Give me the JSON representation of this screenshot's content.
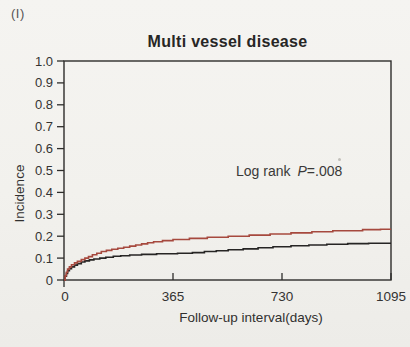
{
  "figure": {
    "panel_label": "(I)"
  },
  "chart_data": {
    "type": "line",
    "subtype": "step-cumulative-incidence",
    "title": "Multi vessel disease",
    "xlabel": "Follow-up interval(days)",
    "ylabel": "Incidence",
    "xlim": [
      0,
      1095
    ],
    "ylim": [
      0,
      1.0
    ],
    "grid": false,
    "legend": "none",
    "axis_color": "#2e2d2b",
    "text_color": "#343332",
    "xticks": [
      {
        "value": 0,
        "label": "0"
      },
      {
        "value": 365,
        "label": "365"
      },
      {
        "value": 730,
        "label": "730"
      },
      {
        "value": 1095,
        "label": "1095"
      }
    ],
    "yticks": [
      {
        "value": 0.0,
        "label": "0"
      },
      {
        "value": 0.1,
        "label": "0.1"
      },
      {
        "value": 0.2,
        "label": "0.2"
      },
      {
        "value": 0.3,
        "label": "0.3"
      },
      {
        "value": 0.4,
        "label": "0.4"
      },
      {
        "value": 0.5,
        "label": "0.5"
      },
      {
        "value": 0.6,
        "label": "0.6"
      },
      {
        "value": 0.7,
        "label": "0.7"
      },
      {
        "value": 0.8,
        "label": "0.8"
      },
      {
        "value": 0.9,
        "label": "0.9"
      },
      {
        "value": 1.0,
        "label": "1.0"
      }
    ],
    "annotation": {
      "prefix": "Log rank",
      "p_symbol": "P",
      "suffix": "=.008"
    },
    "series": [
      {
        "name": "black-curve",
        "color": "#262524",
        "points": [
          [
            0,
            0
          ],
          [
            4,
            0.018
          ],
          [
            8,
            0.03
          ],
          [
            12,
            0.042
          ],
          [
            18,
            0.052
          ],
          [
            25,
            0.06
          ],
          [
            35,
            0.068
          ],
          [
            45,
            0.075
          ],
          [
            58,
            0.082
          ],
          [
            70,
            0.087
          ],
          [
            85,
            0.092
          ],
          [
            100,
            0.096
          ],
          [
            120,
            0.1
          ],
          [
            140,
            0.104
          ],
          [
            165,
            0.108
          ],
          [
            190,
            0.111
          ],
          [
            220,
            0.114
          ],
          [
            260,
            0.117
          ],
          [
            310,
            0.12
          ],
          [
            380,
            0.122
          ],
          [
            430,
            0.125
          ],
          [
            470,
            0.13
          ],
          [
            510,
            0.134
          ],
          [
            550,
            0.138
          ],
          [
            600,
            0.142
          ],
          [
            650,
            0.147
          ],
          [
            700,
            0.152
          ],
          [
            760,
            0.156
          ],
          [
            820,
            0.16
          ],
          [
            880,
            0.163
          ],
          [
            950,
            0.166
          ],
          [
            1020,
            0.168
          ],
          [
            1095,
            0.168
          ]
        ]
      },
      {
        "name": "red-curve",
        "color": "#a6493e",
        "points": [
          [
            0,
            0
          ],
          [
            4,
            0.02
          ],
          [
            8,
            0.035
          ],
          [
            12,
            0.05
          ],
          [
            18,
            0.06
          ],
          [
            25,
            0.07
          ],
          [
            35,
            0.078
          ],
          [
            45,
            0.085
          ],
          [
            58,
            0.093
          ],
          [
            70,
            0.1
          ],
          [
            82,
            0.107
          ],
          [
            95,
            0.115
          ],
          [
            110,
            0.122
          ],
          [
            125,
            0.13
          ],
          [
            142,
            0.135
          ],
          [
            160,
            0.14
          ],
          [
            180,
            0.145
          ],
          [
            200,
            0.15
          ],
          [
            220,
            0.155
          ],
          [
            240,
            0.16
          ],
          [
            260,
            0.165
          ],
          [
            280,
            0.17
          ],
          [
            300,
            0.175
          ],
          [
            330,
            0.18
          ],
          [
            365,
            0.185
          ],
          [
            420,
            0.19
          ],
          [
            480,
            0.195
          ],
          [
            550,
            0.2
          ],
          [
            620,
            0.205
          ],
          [
            690,
            0.21
          ],
          [
            760,
            0.215
          ],
          [
            830,
            0.22
          ],
          [
            900,
            0.225
          ],
          [
            1000,
            0.23
          ],
          [
            1060,
            0.232
          ],
          [
            1095,
            0.232
          ]
        ]
      }
    ]
  }
}
